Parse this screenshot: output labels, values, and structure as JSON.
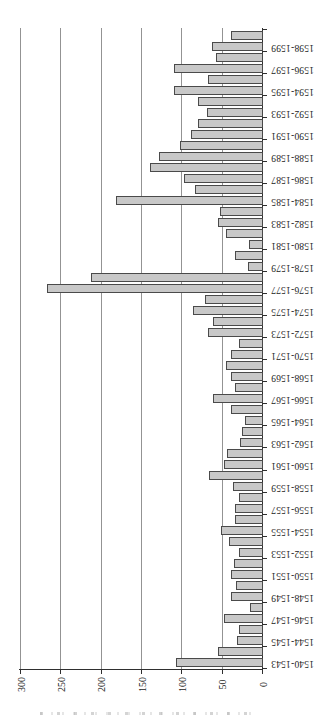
{
  "chart_data": {
    "type": "bar",
    "title": "",
    "xlabel": "",
    "ylabel": "",
    "categories": [
      "1540-1543",
      "1544-1545",
      "1546-1547",
      "1548-1549",
      "1550-1551",
      "1552-1553",
      "1554-1555",
      "1556-1557",
      "1558-1559",
      "1560-1561",
      "1562-1563",
      "1564-1565",
      "1566-1567",
      "1568-1569",
      "1570-1571",
      "1572-1573",
      "1574-1575",
      "1576-1577",
      "1578-1579",
      "1580-1581",
      "1582-1583",
      "1584-1585",
      "1586-1587",
      "1588-1589",
      "1590-1591",
      "1592-1593",
      "1594-1595",
      "1596-1597",
      "1598-1599"
    ],
    "series": [
      {
        "name": "series-1",
        "values": [
          106,
          30,
          46,
          37,
          37,
          27,
          49,
          32,
          35,
          46,
          26,
          20,
          59,
          37,
          37,
          66,
          84,
          265,
          16,
          15,
          53,
          180,
          95,
          126,
          87,
          67,
          108,
          108,
          61
        ]
      },
      {
        "name": "series-2",
        "values": [
          53,
          27,
          14,
          31,
          33,
          40,
          32,
          27,
          65,
          42,
          23,
          37,
          32,
          44,
          27,
          59,
          70,
          211,
          32,
          43,
          51,
          82,
          137,
          100,
          78,
          78,
          66,
          56,
          37
        ]
      }
    ],
    "value_axis": {
      "min": 0,
      "max": 300,
      "tick_values": [
        300,
        250,
        200,
        150,
        100,
        50,
        0
      ],
      "tick_labels": [
        "300",
        "250",
        "200",
        "150",
        "100",
        "50",
        "0"
      ],
      "gridlines": true
    },
    "layout_hint": {
      "orientation": "chart rotated 90deg CCW: bars run horizontally to the left, value axis along bottom reading 300 to 0 left-to-right, category labels on right edge rotated 180deg, first category at bottom",
      "legend": "none",
      "bars_per_category": 2,
      "label_on": "series-1 bar (lower bar of each pair)"
    },
    "colors": {
      "bar_fill": "#c8c8c8",
      "bar_border": "#4a4a4a",
      "gridline": "#939393",
      "axis": "#2f2f2f",
      "text": "#1b1b1b",
      "background": "#ffffff"
    }
  }
}
